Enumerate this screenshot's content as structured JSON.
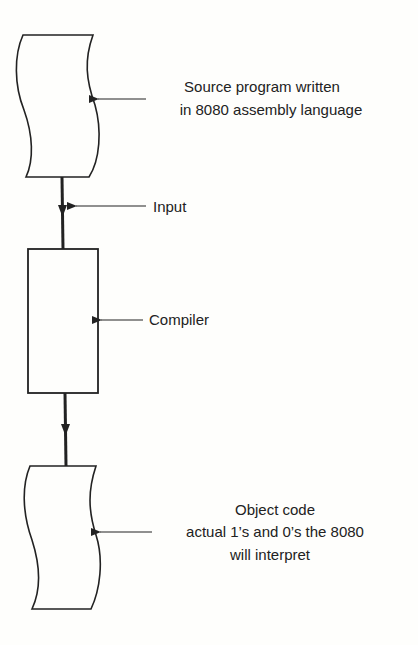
{
  "diagram": {
    "type": "flowchart",
    "nodes": [
      {
        "id": "source",
        "shape": "document",
        "label_lines": [
          "Source program written",
          "in 8080 assembly language"
        ]
      },
      {
        "id": "compiler",
        "shape": "process",
        "label": "Compiler"
      },
      {
        "id": "object",
        "shape": "document",
        "label_lines": [
          "Object code",
          "actual 1’s and 0’s the 8080",
          "will interpret"
        ]
      }
    ],
    "edges": [
      {
        "from": "source",
        "to": "compiler",
        "label": "Input"
      },
      {
        "from": "compiler",
        "to": "object",
        "label": ""
      }
    ]
  },
  "colors": {
    "ink": "#222222",
    "paper": "#fefefc"
  }
}
